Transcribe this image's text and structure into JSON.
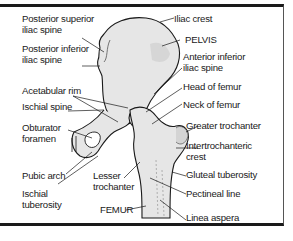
{
  "diagram": {
    "regions": {
      "pelvis": "PELVIS",
      "femur": "FEMUR"
    },
    "labels_left": [
      {
        "id": "posterior-superior-iliac-spine",
        "line1": "Posterior superior",
        "line2": "iliac spine"
      },
      {
        "id": "posterior-inferior-iliac-spine",
        "line1": "Posterior inferior",
        "line2": "iliac spine"
      },
      {
        "id": "acetabular-rim",
        "line1": "Acetabular rim",
        "line2": ""
      },
      {
        "id": "ischial-spine",
        "line1": "Ischial spine",
        "line2": ""
      },
      {
        "id": "obturator-foramen",
        "line1": "Obturator",
        "line2": "foramen"
      },
      {
        "id": "pubic-arch",
        "line1": "Pubic arch",
        "line2": ""
      },
      {
        "id": "ischial-tuberosity",
        "line1": "Ischial",
        "line2": "tuberosity"
      },
      {
        "id": "lesser-trochanter",
        "line1": "Lesser",
        "line2": "trochanter"
      }
    ],
    "labels_right": [
      {
        "id": "iliac-crest",
        "line1": "Iliac crest",
        "line2": ""
      },
      {
        "id": "anterior-inferior-iliac-spine",
        "line1": "Anterior inferior",
        "line2": "iliac spine"
      },
      {
        "id": "head-of-femur",
        "line1": "Head of femur",
        "line2": ""
      },
      {
        "id": "neck-of-femur",
        "line1": "Neck of femur",
        "line2": ""
      },
      {
        "id": "greater-trochanter",
        "line1": "Greater trochanter",
        "line2": ""
      },
      {
        "id": "intertrochanteric-crest",
        "line1": "Intertrochanteric",
        "line2": "crest"
      },
      {
        "id": "gluteal-tuberosity",
        "line1": "Gluteal tuberosity",
        "line2": ""
      },
      {
        "id": "pectineal-line",
        "line1": "Pectineal line",
        "line2": ""
      },
      {
        "id": "linea-aspera",
        "line1": "Linea aspera",
        "line2": ""
      }
    ],
    "colors": {
      "bone_fill": "#e6e6e6",
      "bone_shade": "#c8c8c8",
      "outline": "#1a1a1a",
      "text": "#1a1a1a"
    }
  }
}
